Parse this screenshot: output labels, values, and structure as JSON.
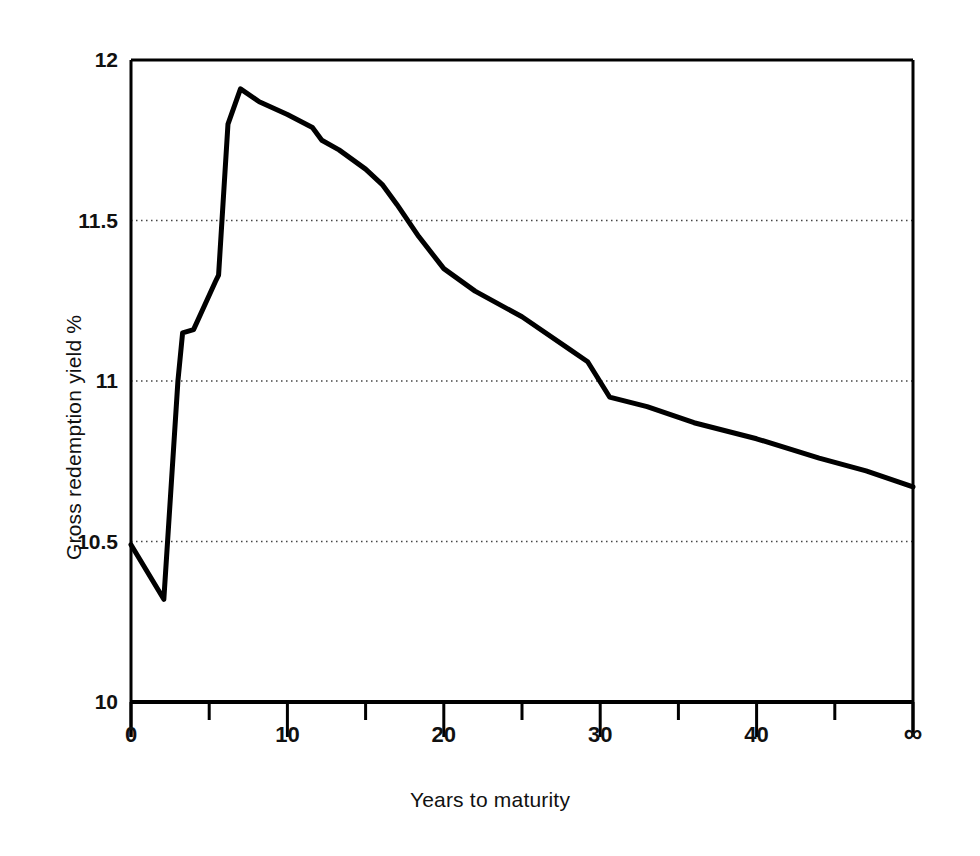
{
  "chart_data": {
    "type": "line",
    "title": "",
    "subtitle": "",
    "xlabel": "Years to maturity",
    "ylabel": "Gross redemption yield %",
    "xlim": [
      0,
      50
    ],
    "ylim": [
      10,
      12
    ],
    "grid": "horizontal dotted at 10.5, 11, 11.5",
    "legend": "none",
    "x_major_ticks": [
      0,
      10,
      20,
      30,
      40,
      50
    ],
    "x_major_tick_labels": [
      "0",
      "10",
      "20",
      "30",
      "40",
      "∞"
    ],
    "x_minor_ticks": [
      5,
      15,
      25,
      35,
      45
    ],
    "y_ticks": [
      10,
      10.5,
      11,
      11.5,
      12
    ],
    "y_tick_labels": [
      "10",
      "10.5",
      "11",
      "11.5",
      "12"
    ],
    "y_gridlines": [
      10.5,
      11,
      11.5
    ],
    "series": [
      {
        "name": "Gross redemption yield",
        "x": [
          0,
          2.1,
          3.0,
          3.3,
          4.0,
          5.4,
          5.6,
          6.2,
          7.0,
          8.2,
          10.0,
          11.6,
          12.2,
          13.3,
          15.0,
          16.1,
          17.0,
          18.4,
          20.0,
          22.0,
          25.0,
          28.0,
          29.2,
          30.6,
          33.0,
          36.0,
          40.0,
          44.0,
          47.0,
          50.0
        ],
        "y": [
          10.49,
          10.32,
          11.0,
          11.15,
          11.16,
          11.31,
          11.33,
          11.8,
          11.91,
          11.87,
          11.83,
          11.79,
          11.75,
          11.72,
          11.66,
          11.61,
          11.55,
          11.45,
          11.35,
          11.28,
          11.2,
          11.1,
          11.06,
          10.95,
          10.92,
          10.87,
          10.82,
          10.76,
          10.72,
          10.67
        ]
      }
    ],
    "notes": {
      "start_value": 10.49,
      "minimum_value": 10.32,
      "minimum_at_years": 2.1,
      "peak_value": 11.91,
      "peak_at_years": 7,
      "perpetual_value": 10.67
    },
    "style": {
      "line_color": "#000000",
      "line_width_px": 5,
      "axis_color": "#000000",
      "grid_color": "#555555",
      "background": "#ffffff"
    }
  },
  "axes": {
    "y_tick_labels": [
      {
        "text": "12",
        "value": 12
      },
      {
        "text": "11.5",
        "value": 11.5
      },
      {
        "text": "11",
        "value": 11
      },
      {
        "text": "10.5",
        "value": 10.5
      },
      {
        "text": "10",
        "value": 10
      }
    ],
    "x_tick_labels": [
      {
        "text": "0",
        "value": 0
      },
      {
        "text": "10",
        "value": 10
      },
      {
        "text": "20",
        "value": 20
      },
      {
        "text": "30",
        "value": 30
      },
      {
        "text": "40",
        "value": 40
      },
      {
        "text": "∞",
        "value": 50
      }
    ],
    "x_title": "Years to maturity",
    "y_title": "Gross redemption yield %"
  }
}
